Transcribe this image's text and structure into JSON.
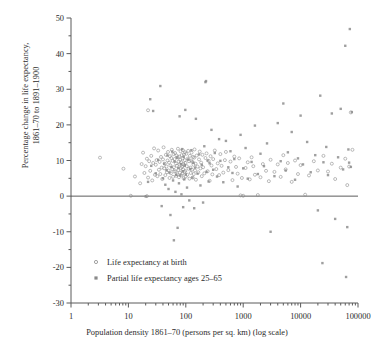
{
  "chart_data": {
    "type": "scatter",
    "title": "",
    "xlabel": "Population density 1861–70 (persons per sq. km) (log scale)",
    "ylabel_line1": "Percentage change in life expectancy,",
    "ylabel_line2": "1861–70 to 1891–1900",
    "xscale": "log",
    "xlim": [
      1,
      100000
    ],
    "ylim": [
      -30,
      50
    ],
    "xticks": [
      1,
      10,
      100,
      1000,
      10000,
      100000
    ],
    "xtick_labels": [
      "1",
      "10",
      "100",
      "1000",
      "10000",
      "100000"
    ],
    "yticks": [
      -30,
      -20,
      -10,
      0,
      10,
      20,
      30,
      40,
      50
    ],
    "ytick_labels": [
      "-30",
      "-20",
      "-10",
      "0",
      "10",
      "20",
      "30",
      "40",
      "50"
    ],
    "yminor_step": 5,
    "grid": false,
    "reference_line_y": 0,
    "marker_color": "#8a8a8a",
    "axis_color": "#5a5a5a",
    "legend": {
      "position": "inside-lower-left",
      "entries": [
        {
          "name": "Life expectancy at birth",
          "marker": "open-circle",
          "color": "#8a8a8a"
        },
        {
          "name": "Partial life expectancy ages 25–65",
          "marker": "filled-square",
          "color": "#8a8a8a"
        }
      ]
    },
    "series": [
      {
        "name": "Life expectancy at birth",
        "marker": "open-circle",
        "points": [
          [
            3.2,
            10.8
          ],
          [
            8.2,
            7.7
          ],
          [
            11,
            0.1
          ],
          [
            13,
            5.5
          ],
          [
            16,
            3.6
          ],
          [
            17,
            9.0
          ],
          [
            18,
            12.2
          ],
          [
            19,
            6.5
          ],
          [
            20,
            8.4
          ],
          [
            21,
            0.0
          ],
          [
            21,
            10.5
          ],
          [
            22,
            24.1
          ],
          [
            22,
            5.2
          ],
          [
            23,
            9.8
          ],
          [
            24,
            7.1
          ],
          [
            25,
            11.3
          ],
          [
            26,
            4.4
          ],
          [
            27,
            9.3
          ],
          [
            28,
            13.4
          ],
          [
            29,
            6.0
          ],
          [
            30,
            8.8
          ],
          [
            31,
            10.1
          ],
          [
            32,
            5.6
          ],
          [
            33,
            12.8
          ],
          [
            34,
            7.4
          ],
          [
            35,
            9.6
          ],
          [
            36,
            6.2
          ],
          [
            37,
            11.0
          ],
          [
            38,
            8.0
          ],
          [
            39,
            4.8
          ],
          [
            40,
            10.3
          ],
          [
            41,
            13.7
          ],
          [
            42,
            7.8
          ],
          [
            43,
            9.1
          ],
          [
            44,
            5.9
          ],
          [
            45,
            11.6
          ],
          [
            46,
            8.3
          ],
          [
            47,
            6.7
          ],
          [
            48,
            10.0
          ],
          [
            49,
            12.4
          ],
          [
            50,
            7.2
          ],
          [
            51,
            9.4
          ],
          [
            52,
            5.1
          ],
          [
            53,
            11.2
          ],
          [
            54,
            8.6
          ],
          [
            55,
            6.4
          ],
          [
            56,
            10.7
          ],
          [
            57,
            13.0
          ],
          [
            58,
            7.6
          ],
          [
            59,
            9.9
          ],
          [
            60,
            5.4
          ],
          [
            61,
            11.8
          ],
          [
            62,
            8.1
          ],
          [
            63,
            6.9
          ],
          [
            64,
            10.4
          ],
          [
            65,
            12.1
          ],
          [
            66,
            7.0
          ],
          [
            67,
            9.2
          ],
          [
            68,
            5.7
          ],
          [
            69,
            11.4
          ],
          [
            70,
            8.5
          ],
          [
            71,
            6.1
          ],
          [
            72,
            10.9
          ],
          [
            73,
            13.3
          ],
          [
            74,
            7.3
          ],
          [
            75,
            9.7
          ],
          [
            76,
            5.3
          ],
          [
            77,
            11.1
          ],
          [
            78,
            8.9
          ],
          [
            79,
            6.6
          ],
          [
            80,
            10.2
          ],
          [
            81,
            12.6
          ],
          [
            82,
            7.9
          ],
          [
            83,
            9.5
          ],
          [
            84,
            5.8
          ],
          [
            85,
            11.5
          ],
          [
            86,
            8.2
          ],
          [
            87,
            6.3
          ],
          [
            88,
            10.6
          ],
          [
            89,
            12.9
          ],
          [
            90,
            7.5
          ],
          [
            91,
            9.0
          ],
          [
            92,
            5.0
          ],
          [
            93,
            11.7
          ],
          [
            94,
            8.7
          ],
          [
            95,
            6.8
          ],
          [
            96,
            10.1
          ],
          [
            97,
            12.3
          ],
          [
            98,
            7.1
          ],
          [
            99,
            9.3
          ],
          [
            100,
            5.5
          ],
          [
            102,
            11.9
          ],
          [
            104,
            8.4
          ],
          [
            106,
            6.0
          ],
          [
            108,
            10.5
          ],
          [
            110,
            12.7
          ],
          [
            112,
            7.7
          ],
          [
            114,
            9.8
          ],
          [
            116,
            4.9
          ],
          [
            118,
            11.3
          ],
          [
            120,
            8.0
          ],
          [
            122,
            6.5
          ],
          [
            124,
            10.0
          ],
          [
            126,
            12.2
          ],
          [
            128,
            7.4
          ],
          [
            130,
            9.6
          ],
          [
            132,
            5.2
          ],
          [
            134,
            11.0
          ],
          [
            136,
            8.8
          ],
          [
            138,
            6.2
          ],
          [
            140,
            10.8
          ],
          [
            142,
            13.1
          ],
          [
            145,
            7.2
          ],
          [
            148,
            9.1
          ],
          [
            150,
            4.6
          ],
          [
            155,
            11.4
          ],
          [
            160,
            8.3
          ],
          [
            165,
            6.7
          ],
          [
            170,
            10.3
          ],
          [
            175,
            12.5
          ],
          [
            180,
            7.8
          ],
          [
            185,
            9.4
          ],
          [
            190,
            5.6
          ],
          [
            195,
            11.6
          ],
          [
            200,
            8.1
          ],
          [
            210,
            6.4
          ],
          [
            220,
            10.7
          ],
          [
            230,
            12.0
          ],
          [
            240,
            7.0
          ],
          [
            250,
            9.9
          ],
          [
            260,
            4.3
          ],
          [
            270,
            11.2
          ],
          [
            280,
            8.6
          ],
          [
            290,
            6.1
          ],
          [
            300,
            10.4
          ],
          [
            320,
            12.8
          ],
          [
            340,
            7.6
          ],
          [
            360,
            9.2
          ],
          [
            380,
            5.9
          ],
          [
            400,
            11.8
          ],
          [
            420,
            8.5
          ],
          [
            450,
            6.6
          ],
          [
            480,
            10.1
          ],
          [
            500,
            12.4
          ],
          [
            550,
            7.3
          ],
          [
            600,
            9.7
          ],
          [
            650,
            4.5
          ],
          [
            700,
            11.1
          ],
          [
            750,
            8.2
          ],
          [
            800,
            6.3
          ],
          [
            850,
            10.6
          ],
          [
            900,
            0.2
          ],
          [
            950,
            5.1
          ],
          [
            1000,
            0.1
          ],
          [
            1100,
            7.9
          ],
          [
            1200,
            9.5
          ],
          [
            1300,
            4.7
          ],
          [
            1400,
            10.9
          ],
          [
            1500,
            8.4
          ],
          [
            1600,
            6.0
          ],
          [
            1800,
            0.3
          ],
          [
            2000,
            5.3
          ],
          [
            2200,
            9.0
          ],
          [
            2500,
            7.1
          ],
          [
            2800,
            4.2
          ],
          [
            3000,
            10.2
          ],
          [
            3500,
            6.8
          ],
          [
            4000,
            8.9
          ],
          [
            4500,
            5.4
          ],
          [
            5000,
            11.5
          ],
          [
            5500,
            7.5
          ],
          [
            6000,
            9.3
          ],
          [
            7000,
            4.0
          ],
          [
            8000,
            10.0
          ],
          [
            9000,
            6.2
          ],
          [
            10000,
            8.7
          ],
          [
            12000,
            0.4
          ],
          [
            14000,
            5.8
          ],
          [
            17000,
            9.8
          ],
          [
            20000,
            7.2
          ],
          [
            25000,
            11.3
          ],
          [
            30000,
            6.9
          ],
          [
            35000,
            9.1
          ],
          [
            40000,
            4.8
          ],
          [
            50000,
            8.0
          ],
          [
            60000,
            10.5
          ],
          [
            65000,
            3.1
          ],
          [
            70000,
            8.3
          ],
          [
            75000,
            23.5
          ],
          [
            80000,
            13.0
          ]
        ]
      },
      {
        "name": "Partial life expectancy ages 25–65",
        "marker": "filled-square",
        "points": [
          [
            20,
            -0.1
          ],
          [
            22,
            4.0
          ],
          [
            24,
            27.2
          ],
          [
            25,
            8.5
          ],
          [
            27,
            23.9
          ],
          [
            30,
            6.4
          ],
          [
            33,
            10.2
          ],
          [
            36,
            30.9
          ],
          [
            38,
            -2.8
          ],
          [
            40,
            5.0
          ],
          [
            42,
            9.1
          ],
          [
            44,
            3.2
          ],
          [
            46,
            7.3
          ],
          [
            48,
            11.4
          ],
          [
            50,
            2.0
          ],
          [
            52,
            6.6
          ],
          [
            54,
            -5.3
          ],
          [
            56,
            8.2
          ],
          [
            58,
            12.5
          ],
          [
            60,
            4.4
          ],
          [
            62,
            -12.4
          ],
          [
            64,
            9.7
          ],
          [
            66,
            1.2
          ],
          [
            68,
            6.0
          ],
          [
            70,
            10.8
          ],
          [
            72,
            -8.9
          ],
          [
            74,
            7.9
          ],
          [
            76,
            3.6
          ],
          [
            78,
            22.4
          ],
          [
            80,
            5.8
          ],
          [
            82,
            9.0
          ],
          [
            84,
            0.5
          ],
          [
            86,
            13.2
          ],
          [
            88,
            7.0
          ],
          [
            90,
            -3.1
          ],
          [
            92,
            11.0
          ],
          [
            94,
            4.7
          ],
          [
            96,
            8.6
          ],
          [
            98,
            24.2
          ],
          [
            100,
            6.1
          ],
          [
            105,
            2.4
          ],
          [
            110,
            10.3
          ],
          [
            115,
            -1.2
          ],
          [
            120,
            7.6
          ],
          [
            125,
            12.9
          ],
          [
            130,
            5.2
          ],
          [
            135,
            9.4
          ],
          [
            140,
            -3.4
          ],
          [
            145,
            8.0
          ],
          [
            150,
            21.7
          ],
          [
            160,
            6.3
          ],
          [
            170,
            11.7
          ],
          [
            180,
            3.0
          ],
          [
            190,
            8.8
          ],
          [
            200,
            -1.8
          ],
          [
            210,
            14.0
          ],
          [
            220,
            32.0
          ],
          [
            225,
            32.3
          ],
          [
            230,
            6.8
          ],
          [
            240,
            10.0
          ],
          [
            250,
            4.1
          ],
          [
            260,
            9.2
          ],
          [
            280,
            18.6
          ],
          [
            300,
            7.4
          ],
          [
            320,
            12.1
          ],
          [
            350,
            5.5
          ],
          [
            380,
            16.0
          ],
          [
            400,
            9.9
          ],
          [
            450,
            3.9
          ],
          [
            500,
            15.5
          ],
          [
            550,
            8.1
          ],
          [
            600,
            12.6
          ],
          [
            650,
            6.5
          ],
          [
            700,
            10.4
          ],
          [
            800,
            2.7
          ],
          [
            900,
            17.2
          ],
          [
            1000,
            7.8
          ],
          [
            1100,
            13.5
          ],
          [
            1200,
            4.9
          ],
          [
            1400,
            9.6
          ],
          [
            1600,
            19.8
          ],
          [
            1800,
            6.2
          ],
          [
            2000,
            11.9
          ],
          [
            2300,
            8.4
          ],
          [
            2600,
            14.8
          ],
          [
            3000,
            -10.0
          ],
          [
            3500,
            5.6
          ],
          [
            4000,
            20.5
          ],
          [
            4500,
            9.8
          ],
          [
            5000,
            26.0
          ],
          [
            5500,
            7.2
          ],
          [
            6000,
            12.3
          ],
          [
            7000,
            18.0
          ],
          [
            8000,
            4.6
          ],
          [
            9000,
            10.6
          ],
          [
            10000,
            22.6
          ],
          [
            11000,
            8.9
          ],
          [
            13000,
            15.2
          ],
          [
            15000,
            6.7
          ],
          [
            18000,
            11.5
          ],
          [
            20000,
            -4.0
          ],
          [
            22000,
            28.2
          ],
          [
            24000,
            -18.8
          ],
          [
            25000,
            9.5
          ],
          [
            28000,
            13.8
          ],
          [
            30000,
            5.9
          ],
          [
            35000,
            23.2
          ],
          [
            40000,
            -6.4
          ],
          [
            45000,
            10.9
          ],
          [
            50000,
            24.5
          ],
          [
            55000,
            7.5
          ],
          [
            60000,
            42.2
          ],
          [
            62000,
            -22.7
          ],
          [
            65000,
            -8.7
          ],
          [
            68000,
            13.1
          ],
          [
            70000,
            9.4
          ],
          [
            72000,
            46.9
          ],
          [
            75000,
            8.2
          ],
          [
            78000,
            23.6
          ]
        ]
      }
    ]
  }
}
